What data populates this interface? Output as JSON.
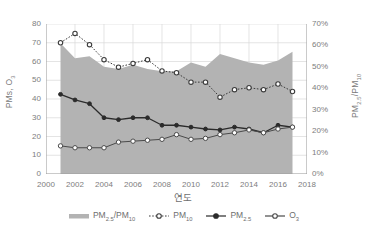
{
  "chart_data": {
    "type": "line",
    "title": "",
    "xlabel": "연도",
    "ylabel_left": "PMs, O₃",
    "ylabel_right": "PM₂.₅/PM₁₀",
    "grid": true,
    "legend_position": "bottom",
    "xlim": [
      2000,
      2018
    ],
    "xticks": [
      "2000",
      "2002",
      "2004",
      "2006",
      "2008",
      "2010",
      "2012",
      "2014",
      "2016",
      "2018"
    ],
    "xtick_values": [
      2000,
      2002,
      2004,
      2006,
      2008,
      2010,
      2012,
      2014,
      2016,
      2018
    ],
    "ylim_left": [
      0,
      80
    ],
    "yticks_left": [
      "0",
      "10",
      "20",
      "30",
      "40",
      "50",
      "60",
      "70",
      "80"
    ],
    "ytick_values_left": [
      0,
      10,
      20,
      30,
      40,
      50,
      60,
      70,
      80
    ],
    "ylim_right": [
      0,
      0.8
    ],
    "yticks_right": [
      "0%",
      "10%",
      "20%",
      "30%",
      "40%",
      "50%",
      "60%",
      "70%"
    ],
    "ytick_values_right": [
      0,
      10,
      20,
      30,
      40,
      50,
      60,
      70
    ],
    "x": [
      2001,
      2002,
      2003,
      2004,
      2005,
      2006,
      2007,
      2008,
      2009,
      2010,
      2011,
      2012,
      2013,
      2014,
      2015,
      2016,
      2017
    ],
    "series": [
      {
        "name": "PM₂.₅/PM₁₀",
        "type": "area",
        "axis": "right",
        "unit": "%",
        "color": "#b3b3b3",
        "values": [
          61,
          54,
          55,
          50,
          49,
          51,
          49,
          48,
          48,
          52,
          50,
          56,
          54,
          52,
          51,
          53,
          57
        ]
      },
      {
        "name": "PM₁₀",
        "type": "line-dotted-open-marker",
        "axis": "left",
        "color": "#3b3b3b",
        "values": [
          70,
          75,
          69,
          61,
          57,
          59,
          61,
          55,
          54,
          49,
          49,
          41,
          45,
          46,
          45,
          48,
          44
        ]
      },
      {
        "name": "PM₂.₅",
        "type": "line-solid-filled-marker",
        "axis": "left",
        "color": "#2b2b2b",
        "values": [
          42.5,
          39.5,
          37.5,
          30,
          29,
          30,
          30,
          26,
          26,
          25,
          24,
          23.5,
          25,
          24,
          22,
          26,
          25
        ]
      },
      {
        "name": "O₃",
        "type": "line-solid-open-marker",
        "axis": "left",
        "color": "#4a4a4a",
        "values": [
          15,
          14,
          14,
          14,
          17,
          17.5,
          18,
          18.5,
          21,
          18.5,
          19,
          21,
          22,
          23.5,
          22,
          24,
          25
        ]
      }
    ]
  },
  "legend": {
    "items": [
      {
        "label_html": "PM<sub>2.5</sub>/PM<sub>10</sub>",
        "label": "PM2.5/PM10",
        "marker": "area-swatch"
      },
      {
        "label_html": "PM<sub>10</sub>",
        "label": "PM10",
        "marker": "dotted-open-marker"
      },
      {
        "label_html": "PM<sub>2.5</sub>",
        "label": "PM2.5",
        "marker": "solid-filled-marker"
      },
      {
        "label_html": "O<sub>3</sub>",
        "label": "O3",
        "marker": "solid-open-marker"
      }
    ]
  },
  "colors": {
    "area": "#b3b3b3",
    "pm10_line": "#3b3b3b",
    "pm25_line": "#2b2b2b",
    "o3_line": "#4a4a4a",
    "grid": "#d9d9d9",
    "axis": "#9a9a9a",
    "text": "#7a7a7a"
  }
}
